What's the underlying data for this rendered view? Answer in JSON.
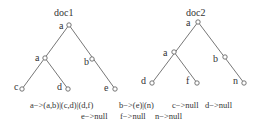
{
  "trees": [
    {
      "title": "doc1",
      "nodes": [
        {
          "id": "root",
          "label": "a"
        },
        {
          "id": "a2",
          "label": "a"
        },
        {
          "id": "b",
          "label": "b"
        },
        {
          "id": "c",
          "label": "c"
        },
        {
          "id": "d",
          "label": "d"
        },
        {
          "id": "e",
          "label": "e"
        }
      ]
    },
    {
      "title": "doc2",
      "nodes": [
        {
          "id": "root",
          "label": "a"
        },
        {
          "id": "a2",
          "label": "a"
        },
        {
          "id": "b",
          "label": "b"
        },
        {
          "id": "d",
          "label": "d"
        },
        {
          "id": "f",
          "label": "f"
        },
        {
          "id": "n",
          "label": "n"
        }
      ]
    }
  ],
  "caption": {
    "line1": [
      "a−>(a,b)|(c,d)|(d,f)",
      "b−>(e)|(n)",
      "c−>null",
      "d−>null"
    ],
    "line2": [
      "e−>null",
      "f−>null",
      "n−>null"
    ]
  }
}
